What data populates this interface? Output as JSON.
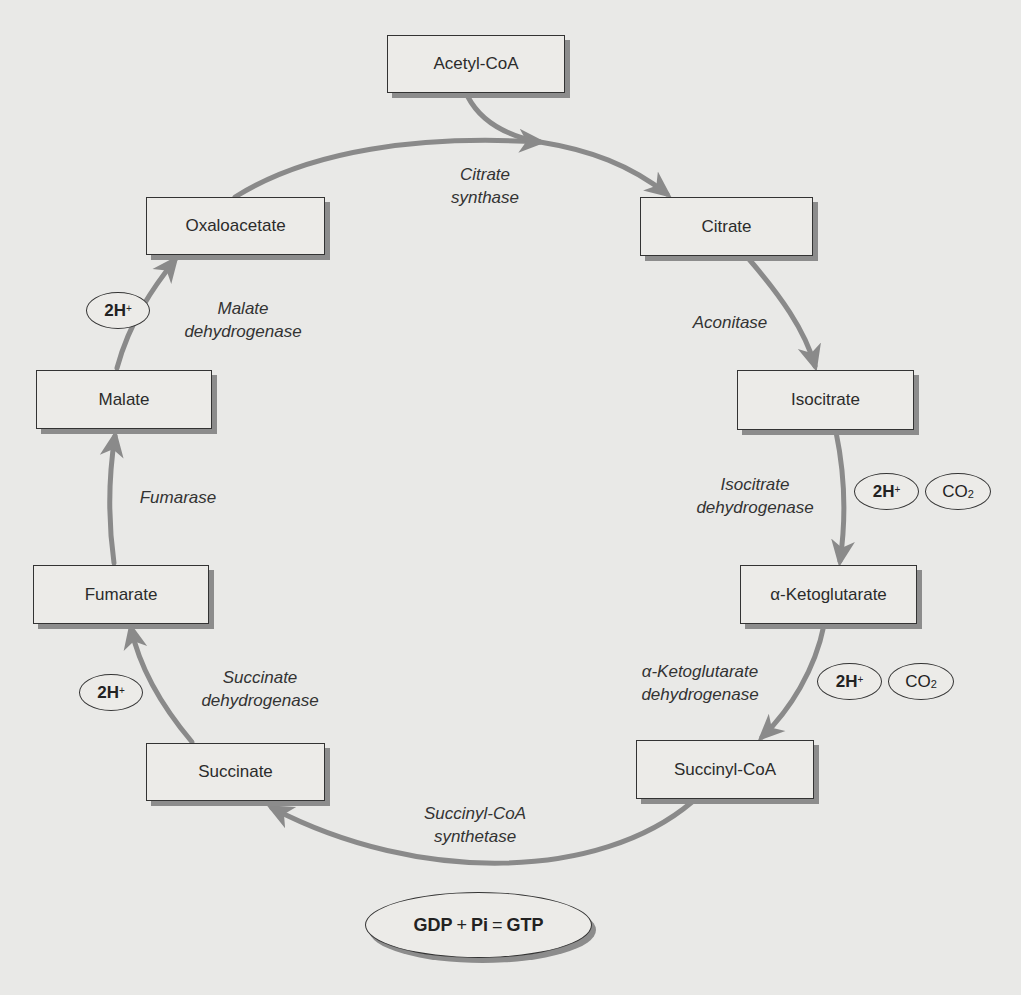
{
  "colors": {
    "background": "#e9e9e7",
    "box_fill": "#ecebe8",
    "box_border": "#333333",
    "box_shadow": "#8c8c8c",
    "arrow": "#8a8a8a"
  },
  "metabolites": {
    "acetyl_coa": "Acetyl-CoA",
    "citrate": "Citrate",
    "isocitrate": "Isocitrate",
    "alpha_ketoglutarate": "α-Ketoglutarate",
    "succinyl_coa": "Succinyl-CoA",
    "succinate": "Succinate",
    "fumarate": "Fumarate",
    "malate": "Malate",
    "oxaloacetate": "Oxaloacetate"
  },
  "enzymes": {
    "citrate_synthase": [
      "Citrate",
      "synthase"
    ],
    "aconitase": [
      "Aconitase"
    ],
    "isocitrate_dehydrogenase": [
      "Isocitrate",
      "dehydrogenase"
    ],
    "akg_dehydrogenase": [
      "α-Ketoglutarate",
      "dehydrogenase"
    ],
    "succinyl_coa_synthetase": [
      "Succinyl-CoA",
      "synthetase"
    ],
    "succinate_dehydrogenase": [
      "Succinate",
      "dehydrogenase"
    ],
    "fumarase": [
      "Fumarase"
    ],
    "malate_dehydrogenase": [
      "Malate",
      "dehydrogenase"
    ]
  },
  "byproducts": {
    "h_label": "2H",
    "h_sup": "+",
    "co2_label": "CO",
    "co2_sub": "2"
  },
  "gtp_reaction": {
    "gdp": "GDP",
    "plus": "+",
    "pi": "Pi",
    "equals": "=",
    "gtp": "GTP"
  }
}
